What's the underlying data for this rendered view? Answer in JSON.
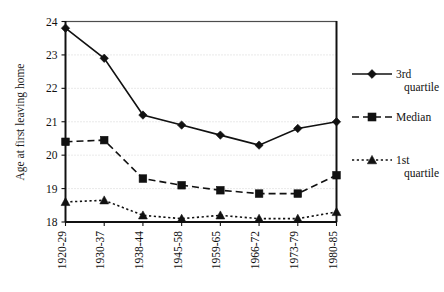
{
  "chart_data": {
    "type": "line",
    "title": "",
    "xlabel": "",
    "ylabel": "Age at first leaving home",
    "categories": [
      "1920-29",
      "1930-37",
      "1938-44",
      "1945-58",
      "1959-65",
      "1966-72",
      "1973-79",
      "1980-85"
    ],
    "ylim": [
      18,
      24
    ],
    "yticks": [
      18,
      19,
      20,
      21,
      22,
      23,
      24
    ],
    "ytick_labels": [
      "18",
      "19",
      "20",
      "21",
      "22",
      "23",
      "24"
    ],
    "grid": true,
    "legend_position": "right",
    "series": [
      {
        "name": "3rd quartile",
        "marker": "diamond",
        "line_style": "solid",
        "color": "#111111",
        "values": [
          23.8,
          22.9,
          21.2,
          20.9,
          20.6,
          20.3,
          20.8,
          21.0
        ]
      },
      {
        "name": "Median",
        "marker": "square",
        "line_style": "dashed",
        "color": "#111111",
        "values": [
          20.4,
          20.45,
          19.3,
          19.1,
          18.95,
          18.85,
          18.85,
          19.4
        ]
      },
      {
        "name": "1st quartile",
        "marker": "triangle",
        "line_style": "dotted",
        "color": "#111111",
        "values": [
          18.6,
          18.65,
          18.2,
          18.1,
          18.2,
          18.1,
          18.1,
          18.3
        ]
      }
    ]
  },
  "legend": {
    "entries": [
      {
        "label_line1": "3rd",
        "label_line2": "quartile"
      },
      {
        "label_line1": "Median",
        "label_line2": ""
      },
      {
        "label_line1": "1st",
        "label_line2": "quartile"
      }
    ]
  },
  "axes": {
    "y_axis_title": "Age at first leaving home"
  }
}
